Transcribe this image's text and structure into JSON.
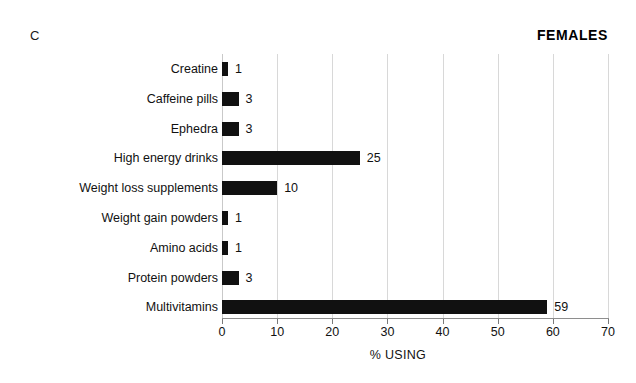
{
  "panel_label": "C",
  "chart_data": {
    "type": "bar",
    "orientation": "horizontal",
    "title": "FEMALES",
    "xlabel": "% USING",
    "ylabel": "",
    "xlim": [
      0,
      70
    ],
    "xticks": [
      0,
      10,
      20,
      30,
      40,
      50,
      60,
      70
    ],
    "grid": true,
    "legend": null,
    "bar_color": "#111111",
    "categories": [
      "Creatine",
      "Caffeine pills",
      "Ephedra",
      "High energy drinks",
      "Weight loss supplements",
      "Weight gain powders",
      "Amino acids",
      "Protein powders",
      "Multivitamins"
    ],
    "values": [
      1,
      3,
      3,
      25,
      10,
      1,
      1,
      3,
      59
    ],
    "data_labels": [
      "1",
      "3",
      "3",
      "25",
      "10",
      "1",
      "1",
      "3",
      "59"
    ]
  }
}
